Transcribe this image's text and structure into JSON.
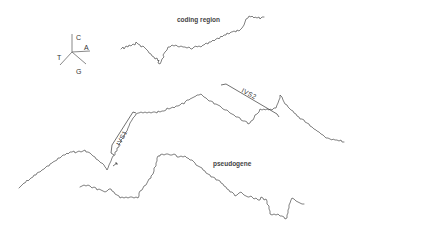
{
  "diagram": {
    "type": "DNA walk plot",
    "legend": {
      "axes": {
        "up": "C",
        "right": "A",
        "left": "T",
        "down": "G"
      }
    },
    "labels": {
      "coding_region": "coding region",
      "pseudogene": "pseudogene",
      "intron1": "IVS1",
      "intron2": "IVS2"
    },
    "traces": [
      {
        "name": "coding region",
        "start": [
          121,
          49
        ],
        "end": [
          244,
          12
        ]
      },
      {
        "name": "genomic gene",
        "start": [
          19,
          188
        ],
        "end": [
          410,
          112
        ]
      },
      {
        "name": "pseudogene",
        "start": [
          80,
          187
        ],
        "end": [
          333,
          210
        ]
      }
    ],
    "colors": {
      "trace": "#4a4a4a",
      "text": "#444444",
      "background": "#ffffff"
    }
  }
}
